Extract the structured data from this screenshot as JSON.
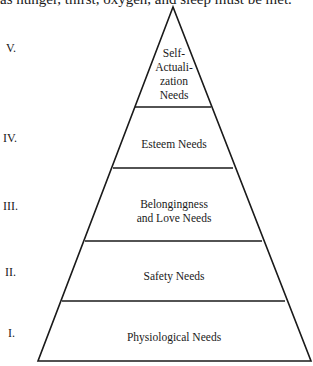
{
  "caption_fragment": "as hunger, thirst, oxygen, and sleep must be met.",
  "pyramid": {
    "title": "Maslow's Hierarchy of Needs",
    "levels": [
      {
        "numeral": "V.",
        "label_lines": [
          "Self-",
          "Actuali-",
          "zation",
          "Needs"
        ]
      },
      {
        "numeral": "IV.",
        "label_lines": [
          "Esteem Needs"
        ]
      },
      {
        "numeral": "III.",
        "label_lines": [
          "Belongingness",
          "and Love Needs"
        ]
      },
      {
        "numeral": "II.",
        "label_lines": [
          "Safety Needs"
        ]
      },
      {
        "numeral": "I.",
        "label_lines": [
          "Physiological Needs"
        ]
      }
    ],
    "line_color": "#1a1a1a"
  }
}
